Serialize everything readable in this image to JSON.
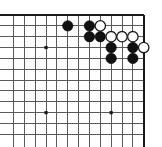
{
  "figure": {
    "board_kind": "go-board"
  },
  "board": {
    "cols": 13,
    "rows": 12,
    "origin_x": 13.5,
    "origin_y": 15.0,
    "spacing": 10.85,
    "edges": {
      "top": true,
      "right": true,
      "bottom": false,
      "left": false
    },
    "colors": {
      "background": "#ffffff",
      "grid": "#595959",
      "edge": "#1a1a1a",
      "black_stone": "#111111",
      "white_stone": "#ffffff",
      "white_stone_outline": "#1a1a1a"
    },
    "stone_radius": 5.2
  },
  "star_points": [
    {
      "col": 3,
      "row": 3
    },
    {
      "col": 3,
      "row": 9
    },
    {
      "col": 9,
      "row": 9
    }
  ],
  "stones": [
    {
      "color": "black",
      "col": 5,
      "row": 1
    },
    {
      "color": "black",
      "col": 7,
      "row": 1
    },
    {
      "color": "white",
      "col": 8,
      "row": 1
    },
    {
      "color": "black",
      "col": 7,
      "row": 2
    },
    {
      "color": "black",
      "col": 8,
      "row": 2
    },
    {
      "color": "white",
      "col": 9,
      "row": 2
    },
    {
      "color": "white",
      "col": 10,
      "row": 2
    },
    {
      "color": "white",
      "col": 11,
      "row": 2
    },
    {
      "color": "black",
      "col": 9,
      "row": 3
    },
    {
      "color": "black",
      "col": 11,
      "row": 3
    },
    {
      "color": "white",
      "col": 12,
      "row": 3
    },
    {
      "color": "black",
      "col": 9,
      "row": 4
    },
    {
      "color": "black",
      "col": 11,
      "row": 4
    }
  ],
  "legend": {
    "black_label": "Black stone",
    "white_label": "White stone",
    "star_label": "Star point"
  }
}
